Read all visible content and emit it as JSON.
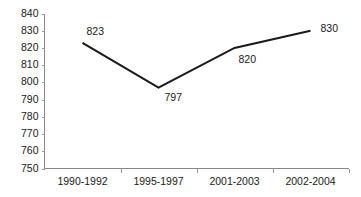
{
  "chart_data": {
    "type": "line",
    "title": "",
    "subtitle": "",
    "xlabel": "",
    "ylabel": "",
    "categories": [
      "1990-1992",
      "1995-1997",
      "2001-2003",
      "2002-2004"
    ],
    "values": [
      823,
      797,
      820,
      830
    ],
    "point_labels": [
      "823",
      "797",
      "820",
      "830"
    ],
    "series": [
      {
        "name": "",
        "values": [
          823,
          797,
          820,
          830
        ],
        "color": "#1a1a1a"
      }
    ],
    "ylim": [
      750,
      840
    ],
    "ytick_labels": [
      "840",
      "830",
      "820",
      "810",
      "800",
      "790",
      "780",
      "770",
      "760",
      "750"
    ],
    "ytick_values": [
      840,
      830,
      820,
      810,
      800,
      790,
      780,
      770,
      760,
      750
    ],
    "grid": false,
    "legend": false,
    "legend_position": "none",
    "axis_color": "#888888",
    "text_color": "#1a1a1a",
    "background": "#ffffff"
  },
  "label_offsets": [
    {
      "dx": 4,
      "dy": -11,
      "anchor": "start"
    },
    {
      "dx": 6,
      "dy": 11,
      "anchor": "start"
    },
    {
      "dx": 4,
      "dy": 12,
      "anchor": "start"
    },
    {
      "dx": 10,
      "dy": -1,
      "anchor": "start"
    }
  ]
}
